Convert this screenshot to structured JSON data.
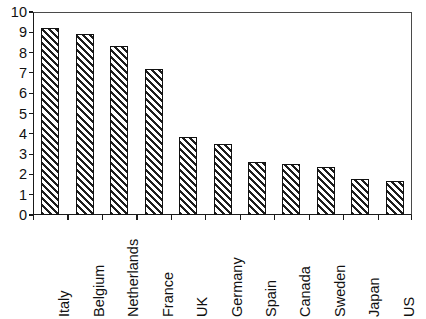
{
  "chart_data": {
    "type": "bar",
    "title": "",
    "subtitle": "",
    "xlabel": "",
    "ylabel": "",
    "categories": [
      "Italy",
      "Belgium",
      "Netherlands",
      "France",
      "UK",
      "Germany",
      "Spain",
      "Canada",
      "Sweden",
      "Japan",
      "US"
    ],
    "values": [
      9.2,
      8.9,
      8.35,
      7.2,
      3.85,
      3.5,
      2.6,
      2.5,
      2.35,
      1.75,
      1.7
    ],
    "series": [
      {
        "name": "",
        "values": [
          9.2,
          8.9,
          8.35,
          7.2,
          3.85,
          3.5,
          2.6,
          2.5,
          2.35,
          1.75,
          1.7
        ]
      }
    ],
    "ylim": [
      0,
      10
    ],
    "ytick_labels": [
      "10",
      "9",
      "8",
      "7",
      "6",
      "5",
      "4",
      "3",
      "2",
      "1",
      "0"
    ],
    "ytick_values": [
      10,
      9,
      8,
      7,
      6,
      5,
      4,
      3,
      2,
      1,
      0
    ],
    "ytick_step": 1,
    "grid": false,
    "legend": false,
    "legend_position": "none",
    "bar_fill": "hatched-diagonal",
    "bar_fill_color": "#1d1d1d",
    "bar_background": "#ffffff",
    "bar_border_color": "#111111",
    "axis_color": "#1a1a1a",
    "xtick_label_rotation": 90,
    "annotations": []
  }
}
